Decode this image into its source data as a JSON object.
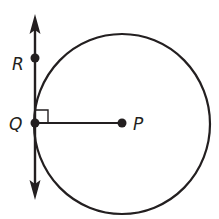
{
  "diagram": {
    "type": "geometry",
    "points": {
      "R": {
        "label": "R",
        "x": 35,
        "y": 58
      },
      "Q": {
        "label": "Q",
        "x": 35,
        "y": 123
      },
      "P": {
        "label": "P",
        "x": 122,
        "y": 123
      }
    },
    "circle": {
      "center": "P",
      "radius": 88
    },
    "segments": [
      {
        "from": "Q",
        "to": "P"
      }
    ],
    "lines": [
      {
        "through": [
          "R",
          "Q"
        ],
        "arrows": "both"
      }
    ],
    "right_angle_at": "Q",
    "colors": {
      "stroke": "#231f20",
      "background": "#ffffff"
    }
  }
}
